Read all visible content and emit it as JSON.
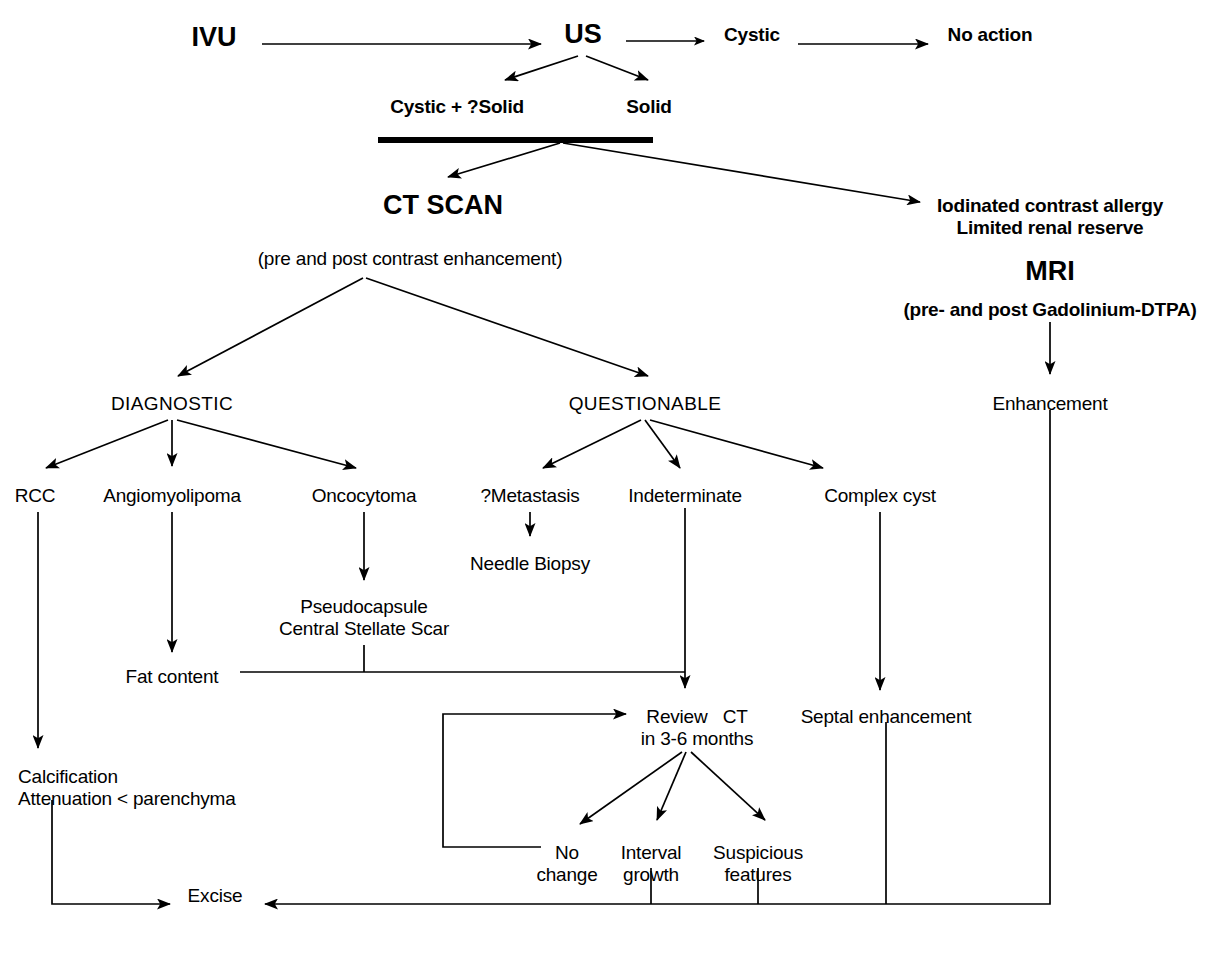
{
  "diagram": {
    "stroke_color": "#000000",
    "background_color": "#ffffff",
    "nodes": [
      {
        "id": "ivu",
        "label": "IVU",
        "x": 214,
        "y": 22,
        "style": "big"
      },
      {
        "id": "us",
        "label": "US",
        "x": 583,
        "y": 19,
        "style": "big"
      },
      {
        "id": "cystic",
        "label": "Cystic",
        "x": 752,
        "y": 24,
        "style": "norm"
      },
      {
        "id": "no_action",
        "label": "No action",
        "x": 990,
        "y": 24,
        "style": "norm"
      },
      {
        "id": "cystic_qsolid",
        "label": "Cystic + ?Solid",
        "x": 457,
        "y": 96,
        "style": "norm"
      },
      {
        "id": "solid",
        "label": "Solid",
        "x": 649,
        "y": 96,
        "style": "norm"
      },
      {
        "id": "ct_scan",
        "label": "CT SCAN",
        "x": 443,
        "y": 190,
        "style": "big"
      },
      {
        "id": "ct_note",
        "label": "(pre and post contrast enhancement)",
        "x": 410,
        "y": 248,
        "style": "norm"
      },
      {
        "id": "iodinated",
        "label": "Iodinated contrast allergy\nLimited renal reserve",
        "x": 1050,
        "y": 195,
        "style": "norm"
      },
      {
        "id": "mri",
        "label": "MRI",
        "x": 1050,
        "y": 256,
        "style": "big"
      },
      {
        "id": "mri_note",
        "label": "(pre- and post Gadolinium-DTPA)",
        "x": 1050,
        "y": 299,
        "style": "norm"
      },
      {
        "id": "diagnostic",
        "label": "DIAGNOSTIC",
        "x": 172,
        "y": 393,
        "style": "caps"
      },
      {
        "id": "questionable",
        "label": "QUESTIONABLE",
        "x": 645,
        "y": 393,
        "style": "caps"
      },
      {
        "id": "enhancement",
        "label": "Enhancement",
        "x": 1050,
        "y": 393,
        "style": "norm"
      },
      {
        "id": "rcc",
        "label": "RCC",
        "x": 35,
        "y": 485,
        "style": "norm"
      },
      {
        "id": "angiomyolipoma",
        "label": "Angiomyolipoma",
        "x": 172,
        "y": 485,
        "style": "norm"
      },
      {
        "id": "oncocytoma",
        "label": "Oncocytoma",
        "x": 364,
        "y": 485,
        "style": "norm"
      },
      {
        "id": "qmetastasis",
        "label": "?Metastasis",
        "x": 530,
        "y": 485,
        "style": "norm"
      },
      {
        "id": "indeterminate",
        "label": "Indeterminate",
        "x": 685,
        "y": 485,
        "style": "norm"
      },
      {
        "id": "complex_cyst",
        "label": "Complex cyst",
        "x": 880,
        "y": 485,
        "style": "norm"
      },
      {
        "id": "needle_biopsy",
        "label": "Needle Biopsy",
        "x": 530,
        "y": 553,
        "style": "norm"
      },
      {
        "id": "pseudocapsule",
        "label": "Pseudocapsule\nCentral Stellate Scar",
        "x": 364,
        "y": 596,
        "style": "norm"
      },
      {
        "id": "fat_content",
        "label": "Fat content",
        "x": 172,
        "y": 666,
        "style": "norm"
      },
      {
        "id": "review_ct",
        "label": "Review   CT\nin 3-6 months",
        "x": 685,
        "y": 706,
        "style": "norm"
      },
      {
        "id": "septal",
        "label": "Septal enhancement",
        "x": 886,
        "y": 706,
        "style": "norm"
      },
      {
        "id": "calcification",
        "label": "Calcification\nAttenuation < parenchyma",
        "x": 18,
        "y": 766,
        "style": "norm-left"
      },
      {
        "id": "no_change",
        "label": "No\nchange",
        "x": 567,
        "y": 842,
        "style": "norm"
      },
      {
        "id": "interval",
        "label": "Interval\ngrowth",
        "x": 651,
        "y": 842,
        "style": "norm"
      },
      {
        "id": "suspicious",
        "label": "Suspicious\nfeatures",
        "x": 758,
        "y": 842,
        "style": "norm"
      },
      {
        "id": "excise",
        "label": "Excise",
        "x": 215,
        "y": 898,
        "style": "norm"
      }
    ],
    "edges": [
      {
        "id": "ivu-to-us",
        "from": "ivu",
        "to": "us",
        "kind": "arrow-straight"
      },
      {
        "id": "us-to-cystic",
        "from": "us",
        "to": "cystic",
        "kind": "arrow-straight"
      },
      {
        "id": "cystic-to-no-action",
        "from": "cystic",
        "to": "no_action",
        "kind": "arrow-straight"
      },
      {
        "id": "us-to-cystic-qsolid",
        "from": "us",
        "to": "cystic_qsolid",
        "kind": "arrow-diagonal"
      },
      {
        "id": "us-to-solid",
        "from": "us",
        "to": "solid",
        "kind": "arrow-diagonal"
      },
      {
        "id": "bar-to-ct-scan",
        "from": "thick-bar",
        "to": "ct_scan",
        "kind": "arrow-diagonal"
      },
      {
        "id": "bar-to-iodinated",
        "from": "thick-bar",
        "to": "iodinated",
        "kind": "arrow-diagonal"
      },
      {
        "id": "mri-to-enhancement",
        "from": "mri_note",
        "to": "enhancement",
        "kind": "arrow-vertical"
      },
      {
        "id": "ct-to-diagnostic",
        "from": "ct_note",
        "to": "diagnostic",
        "kind": "arrow-diagonal"
      },
      {
        "id": "ct-to-questionable",
        "from": "ct_note",
        "to": "questionable",
        "kind": "arrow-diagonal"
      },
      {
        "id": "diagnostic-to-rcc",
        "from": "diagnostic",
        "to": "rcc",
        "kind": "arrow-diagonal"
      },
      {
        "id": "diagnostic-to-angio",
        "from": "diagnostic",
        "to": "angiomyolipoma",
        "kind": "arrow-vertical"
      },
      {
        "id": "diagnostic-to-oncocytoma",
        "from": "diagnostic",
        "to": "oncocytoma",
        "kind": "arrow-diagonal"
      },
      {
        "id": "questionable-to-qmeta",
        "from": "questionable",
        "to": "qmetastasis",
        "kind": "arrow-diagonal"
      },
      {
        "id": "questionable-to-indet",
        "from": "questionable",
        "to": "indeterminate",
        "kind": "arrow-diagonal"
      },
      {
        "id": "questionable-to-cyst",
        "from": "questionable",
        "to": "complex_cyst",
        "kind": "arrow-diagonal"
      },
      {
        "id": "qmeta-to-needle",
        "from": "qmetastasis",
        "to": "needle_biopsy",
        "kind": "arrow-vertical"
      },
      {
        "id": "oncocytoma-to-pseudo",
        "from": "oncocytoma",
        "to": "pseudocapsule",
        "kind": "arrow-vertical"
      },
      {
        "id": "angio-to-fat",
        "from": "angiomyolipoma",
        "to": "fat_content",
        "kind": "arrow-vertical"
      },
      {
        "id": "fat-bus-to-indet",
        "from": "fat_content",
        "to": "indeterminate",
        "kind": "orthogonal-bus"
      },
      {
        "id": "indet-to-review",
        "from": "indeterminate",
        "to": "review_ct",
        "kind": "arrow-vertical"
      },
      {
        "id": "cyst-to-septal",
        "from": "complex_cyst",
        "to": "septal",
        "kind": "arrow-vertical"
      },
      {
        "id": "review-to-no-change",
        "from": "review_ct",
        "to": "no_change",
        "kind": "arrow-diagonal"
      },
      {
        "id": "review-to-interval",
        "from": "review_ct",
        "to": "interval",
        "kind": "arrow-diagonal"
      },
      {
        "id": "review-to-suspicious",
        "from": "review_ct",
        "to": "suspicious",
        "kind": "arrow-diagonal"
      },
      {
        "id": "no-change-loop-to-review",
        "from": "no_change",
        "to": "review_ct",
        "kind": "feedback-loop"
      },
      {
        "id": "rcc-to-calcification",
        "from": "rcc",
        "to": "calcification",
        "kind": "arrow-vertical"
      },
      {
        "id": "calcification-to-excise",
        "from": "calcification",
        "to": "excise",
        "kind": "orthogonal-arrow"
      },
      {
        "id": "interval-to-excise",
        "from": "interval",
        "to": "excise",
        "kind": "orthogonal-arrow"
      },
      {
        "id": "suspicious-to-excise",
        "from": "suspicious",
        "to": "excise",
        "kind": "orthogonal-arrow"
      },
      {
        "id": "septal-to-excise",
        "from": "septal",
        "to": "excise",
        "kind": "orthogonal-arrow"
      },
      {
        "id": "enhancement-to-excise",
        "from": "enhancement",
        "to": "excise",
        "kind": "orthogonal-arrow"
      }
    ]
  }
}
